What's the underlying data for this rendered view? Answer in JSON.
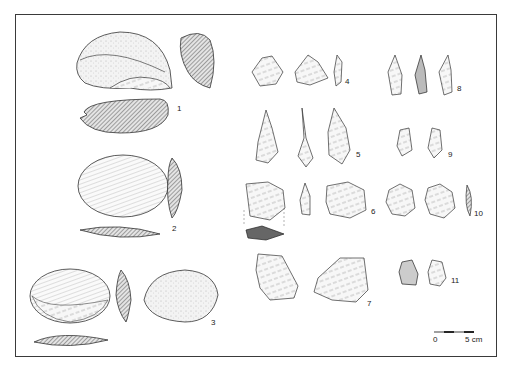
{
  "plate": {
    "figure_labels": [
      "1",
      "2",
      "3",
      "4",
      "5",
      "6",
      "7",
      "8",
      "9",
      "10",
      "11"
    ],
    "scale_bar": {
      "start_label": "0",
      "end_label": "5 cm"
    }
  },
  "colors": {
    "frame": "#3a3a3a",
    "hatch": "#555555",
    "ink": "#2a2a2a"
  }
}
